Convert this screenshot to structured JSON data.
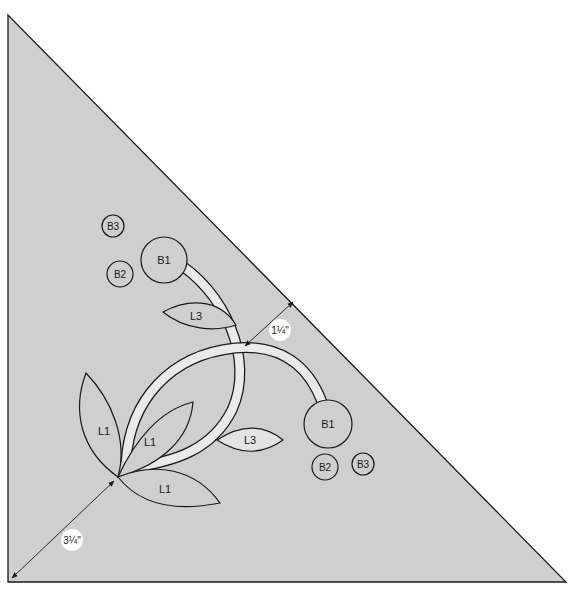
{
  "diagram": {
    "type": "applique-placement-template",
    "colors": {
      "background": "#ffffff",
      "block_fill": "#cfcfcf",
      "outline": "#1a1a1a",
      "stem_fill": "#eaeaea",
      "piece_fill": "#cfcfcf",
      "light_piece_fill": "#e3e3e3",
      "label_badge": "#ffffff"
    },
    "block": {
      "shape": "right-triangle",
      "vertices": [
        [
          8,
          15
        ],
        [
          8,
          582
        ],
        [
          566,
          582
        ]
      ]
    },
    "measurements": [
      {
        "id": "corner-offset",
        "label": "3¼\""
      },
      {
        "id": "edge-offset",
        "label": "1¼\""
      }
    ],
    "pieces": [
      {
        "id": "b3-upper",
        "label": "B3",
        "type": "circle"
      },
      {
        "id": "b2-upper",
        "label": "B2",
        "type": "circle"
      },
      {
        "id": "b1-upper",
        "label": "B1",
        "type": "circle"
      },
      {
        "id": "l3-upper",
        "label": "L3",
        "type": "leaf"
      },
      {
        "id": "l1-left",
        "label": "L1",
        "type": "leaf"
      },
      {
        "id": "l1-middle",
        "label": "L1",
        "type": "leaf"
      },
      {
        "id": "l1-bottom",
        "label": "L1",
        "type": "leaf"
      },
      {
        "id": "l3-lower",
        "label": "L3",
        "type": "leaf"
      },
      {
        "id": "b1-lower",
        "label": "B1",
        "type": "circle"
      },
      {
        "id": "b2-lower",
        "label": "B2",
        "type": "circle"
      },
      {
        "id": "b3-lower",
        "label": "B3",
        "type": "circle"
      }
    ]
  }
}
